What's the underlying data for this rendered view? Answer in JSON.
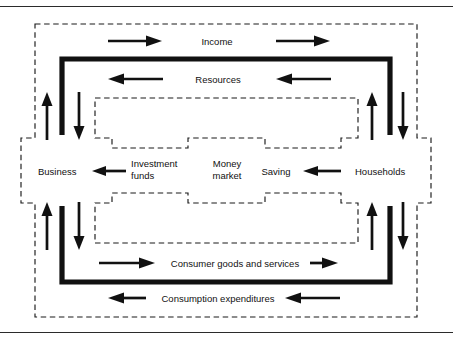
{
  "figure": {
    "sectors": [
      {
        "id": "business",
        "label": "Business"
      },
      {
        "id": "households",
        "label": "Households"
      }
    ],
    "markets": [
      {
        "id": "money-market",
        "label_line1": "Money",
        "label_line2": "market"
      }
    ],
    "flows": [
      {
        "id": "income",
        "label": "Income",
        "direction": "right"
      },
      {
        "id": "resources",
        "label": "Resources",
        "direction": "left"
      },
      {
        "id": "investment-funds",
        "label_line1": "Investment",
        "label_line2": "funds",
        "direction": "left"
      },
      {
        "id": "saving",
        "label": "Saving",
        "direction": "left"
      },
      {
        "id": "consumer-goods",
        "label": "Consumer goods and services",
        "direction": "right"
      },
      {
        "id": "consumption-expenditures",
        "label": "Consumption expenditures",
        "direction": "left"
      }
    ],
    "colors": {
      "ink": "#111111",
      "rule": "#2b2b2b",
      "background": "#ffffff"
    }
  }
}
